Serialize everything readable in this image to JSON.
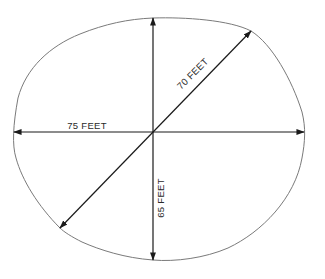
{
  "diagram": {
    "colors": {
      "outline": "#7a7a7a",
      "dimension_lines": "#1a1a1a",
      "text": "#2a2a2a",
      "background": "#ffffff"
    },
    "dimensions": [
      {
        "id": "horizontal",
        "label": "75 FEET",
        "orientation": "horizontal"
      },
      {
        "id": "diagonal",
        "label": "70 FEET",
        "orientation": "diagonal"
      },
      {
        "id": "vertical",
        "label": "65 FEET",
        "orientation": "vertical"
      }
    ]
  }
}
